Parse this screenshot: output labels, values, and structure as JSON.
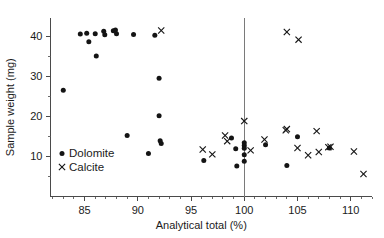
{
  "chart_data": {
    "type": "scatter",
    "title": "",
    "xlabel": "Analytical total (%)",
    "ylabel": "Sample weight (mg)",
    "xlim": [
      81.8,
      112.0
    ],
    "ylim": [
      0.0,
      44.5
    ],
    "xticks": [
      85,
      90,
      95,
      100,
      105,
      110
    ],
    "xtick_labels": [
      "85",
      "90",
      "95",
      "100",
      "105",
      "110"
    ],
    "yticks": [
      10,
      20,
      30,
      40
    ],
    "ytick_labels": [
      "10",
      "20",
      "30",
      "40"
    ],
    "minor_xtick_step": 1,
    "grid": false,
    "legend_position": "lower-left-inside",
    "annotations": [
      {
        "name": "reference-line-100",
        "type": "vline",
        "x": 100.0
      }
    ],
    "series": [
      {
        "name": "Dolomite",
        "marker": "circle",
        "color": "#141414",
        "points": [
          [
            83.0,
            26.5
          ],
          [
            84.6,
            40.5
          ],
          [
            85.2,
            40.7
          ],
          [
            85.4,
            38.6
          ],
          [
            86.0,
            40.6
          ],
          [
            86.1,
            35.0
          ],
          [
            86.8,
            41.2
          ],
          [
            86.9,
            40.3
          ],
          [
            87.7,
            41.3
          ],
          [
            87.9,
            41.5
          ],
          [
            88.0,
            40.6
          ],
          [
            89.0,
            15.2
          ],
          [
            89.6,
            40.4
          ],
          [
            91.0,
            10.7
          ],
          [
            91.6,
            40.2
          ],
          [
            92.0,
            20.1
          ],
          [
            92.1,
            13.9
          ],
          [
            92.2,
            13.2
          ],
          [
            92.0,
            29.5
          ],
          [
            96.2,
            9.0
          ],
          [
            98.8,
            14.6
          ],
          [
            99.2,
            11.9
          ],
          [
            99.3,
            7.6
          ],
          [
            100.0,
            13.4
          ],
          [
            100.0,
            12.7
          ],
          [
            100.0,
            12.0
          ],
          [
            100.0,
            10.4
          ],
          [
            100.0,
            8.8
          ],
          [
            102.0,
            12.9
          ],
          [
            104.0,
            7.7
          ],
          [
            105.0,
            14.9
          ],
          [
            108.0,
            12.1
          ]
        ]
      },
      {
        "name": "Calcite",
        "marker": "cross",
        "color": "#141414",
        "points": [
          [
            92.2,
            41.4
          ],
          [
            104.0,
            41.0
          ],
          [
            105.1,
            39.1
          ],
          [
            96.1,
            11.7
          ],
          [
            97.0,
            10.5
          ],
          [
            98.2,
            15.2
          ],
          [
            98.4,
            13.8
          ],
          [
            100.0,
            18.8
          ],
          [
            100.6,
            11.5
          ],
          [
            101.9,
            14.2
          ],
          [
            103.9,
            16.5
          ],
          [
            104.0,
            16.8
          ],
          [
            105.0,
            12.1
          ],
          [
            106.0,
            10.3
          ],
          [
            106.8,
            16.3
          ],
          [
            107.0,
            11.1
          ],
          [
            107.9,
            12.3
          ],
          [
            108.1,
            12.4
          ],
          [
            110.3,
            11.2
          ],
          [
            111.2,
            5.6
          ]
        ]
      }
    ]
  },
  "legend": {
    "items": [
      {
        "marker_name": "dot-marker",
        "label": "Dolomite"
      },
      {
        "marker_name": "cross-marker",
        "label": "Calcite"
      }
    ]
  },
  "axes": {
    "x_title": "Analytical total (%)",
    "y_title": "Sample weight (mg)"
  }
}
